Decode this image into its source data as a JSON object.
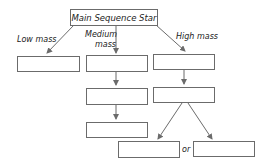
{
  "diagram": {
    "root": {
      "label": "Main Sequence Star"
    },
    "branches": [
      {
        "label": "Low mass",
        "boxes": [
          ""
        ]
      },
      {
        "label_line1": "Medium",
        "label_line2": "mass",
        "boxes": [
          "",
          "",
          ""
        ]
      },
      {
        "label": "High mass",
        "boxes": [
          "",
          ""
        ],
        "outcomes": [
          "",
          ""
        ]
      }
    ],
    "connector_word": "or",
    "colors": {
      "line": "#6b6b6b",
      "text": "#222222"
    }
  }
}
